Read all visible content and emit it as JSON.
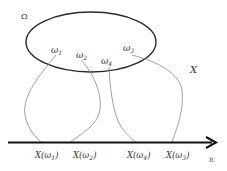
{
  "diagram": {
    "sample_space_label": "Ω",
    "mapping_label": "X",
    "axis_label": "R",
    "outcomes": [
      {
        "id": "w1",
        "symbol": "ω",
        "sub": "1"
      },
      {
        "id": "w2",
        "symbol": "ω",
        "sub": "2"
      },
      {
        "id": "w4",
        "symbol": "ω",
        "sub": "4"
      },
      {
        "id": "w3",
        "symbol": "ω",
        "sub": "3"
      }
    ],
    "images": [
      {
        "label": "X(ω",
        "sub": "1",
        "close": ")"
      },
      {
        "label": "X(ω",
        "sub": "2",
        "close": ")"
      },
      {
        "label": "X(ω",
        "sub": "4",
        "close": ")"
      },
      {
        "label": "X(ω",
        "sub": "3",
        "close": ")"
      }
    ],
    "colors": {
      "ellipse": "#2a2a2a",
      "axis": "#111111",
      "curves": "#8a8a8a",
      "text": "#333333"
    }
  }
}
